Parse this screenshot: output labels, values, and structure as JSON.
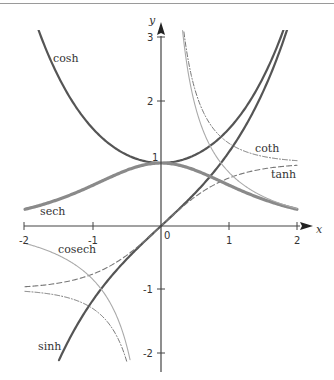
{
  "chart_data": {
    "type": "line",
    "title": "",
    "xlabel": "x",
    "ylabel": "y",
    "xlim": [
      -2,
      2
    ],
    "ylim": [
      -2.2,
      3.2
    ],
    "grid": false,
    "legend": "inline labels",
    "x_ticks": [
      "-2",
      "-1",
      "0",
      "1",
      "2"
    ],
    "y_ticks": [
      "-2",
      "-1",
      "1",
      "2",
      "3"
    ],
    "origin_label": "0",
    "series": [
      {
        "name": "cosh",
        "style": "solid-thick-dark",
        "color": "#555555",
        "x": [
          -1.8,
          -1.5,
          -1.0,
          -0.5,
          0,
          0.5,
          1.0,
          1.5,
          1.8
        ],
        "y": [
          3.11,
          2.35,
          1.54,
          1.13,
          1.0,
          1.13,
          1.54,
          2.35,
          3.11
        ]
      },
      {
        "name": "sinh",
        "style": "solid-thick-dark",
        "color": "#555555",
        "x": [
          -1.5,
          -1.0,
          -0.5,
          0,
          0.5,
          1.0,
          1.5,
          1.85
        ],
        "y": [
          -2.13,
          -1.18,
          -0.52,
          0,
          0.52,
          1.18,
          2.13,
          3.1
        ]
      },
      {
        "name": "tanh",
        "style": "dashed",
        "color": "#777777",
        "x": [
          -2,
          -1.5,
          -1,
          -0.5,
          0,
          0.5,
          1,
          1.5,
          2
        ],
        "y": [
          -0.96,
          -0.91,
          -0.76,
          -0.46,
          0,
          0.46,
          0.76,
          0.91,
          0.96
        ]
      },
      {
        "name": "sech",
        "style": "solid-thick-light",
        "color": "#888888",
        "x": [
          -2,
          -1.5,
          -1,
          -0.5,
          0,
          0.5,
          1,
          1.5,
          2
        ],
        "y": [
          0.27,
          0.43,
          0.65,
          0.89,
          1.0,
          0.89,
          0.65,
          0.43,
          0.27
        ]
      },
      {
        "name": "coth",
        "style": "dash-dot",
        "color": "#777777",
        "x": [
          0.33,
          0.5,
          1,
          1.5,
          2
        ],
        "y": [
          3.1,
          2.16,
          1.31,
          1.1,
          1.04
        ]
      },
      {
        "name": "cosech",
        "style": "solid-thin-light",
        "color": "#aaaaaa",
        "x": [
          0.3,
          0.5,
          1,
          1.5,
          2
        ],
        "y": [
          3.28,
          1.92,
          0.85,
          0.47,
          0.28
        ]
      }
    ],
    "annotations": [
      {
        "text": "cosh",
        "x": -1.55,
        "y": 2.7
      },
      {
        "text": "sech",
        "x": -1.75,
        "y": 0.15
      },
      {
        "text": "coth",
        "x": 1.65,
        "y": 1.2
      },
      {
        "text": "tanh",
        "x": 1.7,
        "y": 0.75
      },
      {
        "text": "cosech",
        "x": -1.0,
        "y": -0.35
      },
      {
        "text": "sinh",
        "x": -1.6,
        "y": -1.85
      }
    ]
  },
  "axes": {
    "x_label": "x",
    "y_label": "y",
    "origin": "0",
    "x_ticks": [
      {
        "v": -2,
        "label": "-2"
      },
      {
        "v": -1,
        "label": "-1"
      },
      {
        "v": 1,
        "label": "1"
      },
      {
        "v": 2,
        "label": "2"
      }
    ],
    "y_ticks": [
      {
        "v": -2,
        "label": "-2"
      },
      {
        "v": -1,
        "label": "-1"
      },
      {
        "v": 1,
        "label": "1"
      },
      {
        "v": 2,
        "label": "2"
      },
      {
        "v": 3,
        "label": "3"
      }
    ]
  },
  "labels": {
    "cosh": "cosh",
    "sech": "sech",
    "coth": "coth",
    "tanh": "tanh",
    "cosech": "cosech",
    "sinh": "sinh"
  }
}
